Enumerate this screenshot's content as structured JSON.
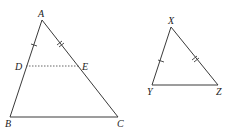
{
  "diagram": {
    "triangle_abc": {
      "vertices": {
        "A": {
          "label": "A",
          "x": 42,
          "y": 20
        },
        "B": {
          "label": "B",
          "x": 10,
          "y": 117
        },
        "C": {
          "label": "C",
          "x": 118,
          "y": 117
        }
      },
      "points_on_sides": {
        "D": {
          "label": "D",
          "x": 26,
          "y": 66
        },
        "E": {
          "label": "E",
          "x": 80,
          "y": 66
        }
      },
      "segment_de_style": "dotted",
      "tick_marks": [
        {
          "segment": "AD",
          "count": 1
        },
        {
          "segment": "AE",
          "count": 2
        }
      ]
    },
    "triangle_xyz": {
      "vertices": {
        "X": {
          "label": "X",
          "x": 171,
          "y": 27
        },
        "Y": {
          "label": "Y",
          "x": 152,
          "y": 85
        },
        "Z": {
          "label": "Z",
          "x": 218,
          "y": 85
        }
      },
      "tick_marks": [
        {
          "segment": "XY",
          "count": 1
        },
        {
          "segment": "XZ",
          "count": 2
        }
      ]
    },
    "colors": {
      "line": "#3a3a3a",
      "label": "#222222",
      "background": "#ffffff"
    }
  }
}
